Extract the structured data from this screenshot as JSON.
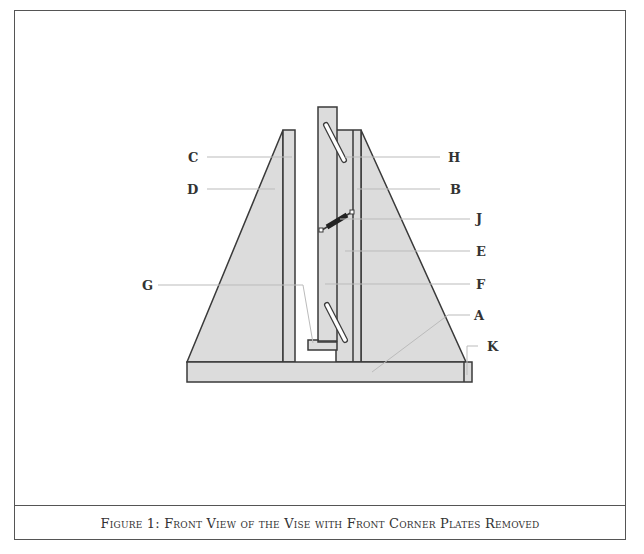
{
  "figure": {
    "caption": "Figure 1:  Front View of the Vise with Front Corner Plates Removed",
    "colors": {
      "part_fill": "#dcdcdc",
      "outline": "#3a3a3a",
      "leader": "#bbbbbb",
      "background": "#ffffff"
    }
  },
  "labels": {
    "A": "A",
    "B": "B",
    "C": "C",
    "D": "D",
    "E": "E",
    "F": "F",
    "G": "G",
    "H": "H",
    "J": "J",
    "K": "K"
  }
}
